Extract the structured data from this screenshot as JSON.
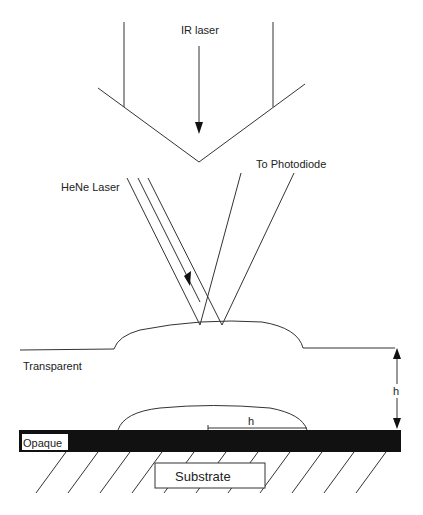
{
  "diagram": {
    "labels": {
      "ir_laser": "IR laser",
      "hene_laser": "HeNe Laser",
      "to_photodiode": "To Photodiode",
      "transparent": "Transparent",
      "height_marker": "h",
      "bump_width_marker": "h",
      "opaque": "Opaque",
      "substrate": "Substrate"
    },
    "colors": {
      "stroke": "#333333",
      "opaque_layer": "#111111",
      "background": "#ffffff"
    }
  }
}
